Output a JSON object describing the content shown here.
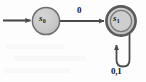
{
  "figure": {
    "type": "finite-state-automaton",
    "background_color": "#fdfdfd"
  },
  "states": [
    {
      "id": "s0",
      "label_base": "s",
      "label_subscript": "0",
      "accepting": false,
      "start": true,
      "cx": 46,
      "cy": 21,
      "r": 14,
      "fill_color": "#c9c9c9",
      "stroke_color": "#6e6e6e"
    },
    {
      "id": "s1",
      "label_base": "s",
      "label_subscript": "1",
      "accepting": true,
      "start": false,
      "cx": 121,
      "cy": 21,
      "r": 15,
      "inner_r": 11,
      "fill_color": "#c9c9c9",
      "stroke_color": "#5a5a5a"
    }
  ],
  "transitions": [
    {
      "id": "start-arrow",
      "from": null,
      "to": "s0",
      "label": "",
      "kind": "start"
    },
    {
      "id": "s0-to-s1",
      "from": "s0",
      "to": "s1",
      "label": "0",
      "kind": "straight"
    },
    {
      "id": "s1-self-loop",
      "from": "s1",
      "to": "s1",
      "label": "0,1",
      "kind": "self-loop"
    }
  ],
  "labels": {
    "edge_s0_s1": "0",
    "self_loop_s1": "0,1"
  },
  "colors": {
    "state_fill": "#c9c9c9",
    "state_stroke": "#6e6e6e",
    "accept_stroke": "#5a5a5a",
    "arrow": "#4a4a4a",
    "text": "#141414"
  }
}
